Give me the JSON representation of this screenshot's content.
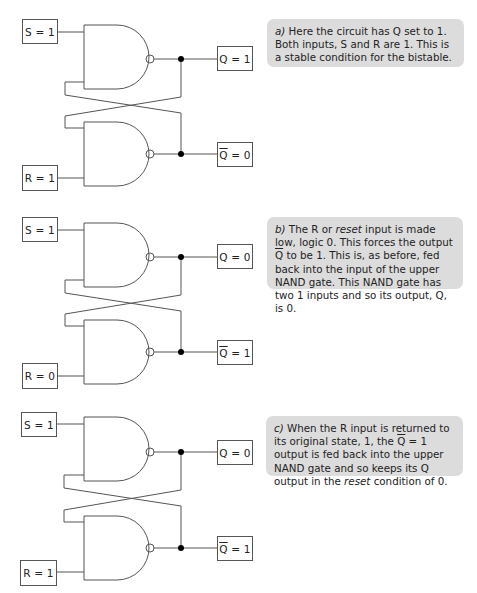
{
  "panels": [
    {
      "id": "a",
      "inputs": {
        "s": "S = 1",
        "r": "R = 1"
      },
      "outputs": {
        "q": "Q = 1",
        "qbar_symbol": "Q",
        "qbar_value": "= 0"
      },
      "note": {
        "label": "a)",
        "text": "Here the circuit has Q set to 1. Both inputs, S and R are 1. This is a stable condition for the bistable."
      }
    },
    {
      "id": "b",
      "inputs": {
        "s": "S = 1",
        "r": "R = 0"
      },
      "outputs": {
        "q": "Q = 0",
        "qbar_symbol": "Q",
        "qbar_value": "= 1"
      },
      "note": {
        "label": "b)",
        "text_1": "The R or ",
        "emph_1": "reset",
        "text_2": " input is made low, logic 0. This forces the output ",
        "qbar": "Q",
        "text_3": " to be 1. This is, as before, fed back into the input of the upper NAND gate. This NAND gate has two 1 inputs and so its output, Q, is 0."
      }
    },
    {
      "id": "c",
      "inputs": {
        "s": "S = 1",
        "r": "R = 1"
      },
      "outputs": {
        "q": "Q = 0",
        "qbar_symbol": "Q",
        "qbar_value": "= 1"
      },
      "note": {
        "label": "c)",
        "text_1": "When the R input is returned to its original state, 1, the ",
        "qbar": "Q",
        "text_2": " = 1 output is fed back into the upper NAND gate and so keeps its Q output in the ",
        "emph_1": "reset",
        "text_3": " condition of 0."
      }
    }
  ],
  "colors": {
    "wire": "#555555",
    "label_border": "#555555",
    "note_background": "#dcdcdc",
    "junction": "#000000"
  }
}
